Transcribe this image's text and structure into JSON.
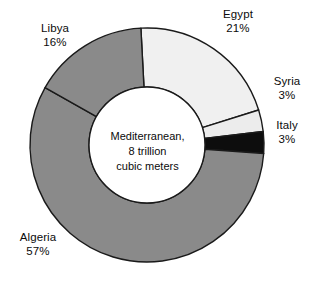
{
  "chart_data": {
    "type": "pie",
    "variant": "donut",
    "title": "",
    "subtitle": "",
    "xlabel": "",
    "ylabel": "",
    "legend_position": "none",
    "grid": false,
    "center_label": {
      "line1": "Mediterranean,",
      "line2": "8 trillion",
      "line3": "cubic meters"
    },
    "total_label": "8 trillion cubic meters",
    "unit": "trillion cubic meters",
    "categories": [
      "Egypt",
      "Syria",
      "Italy",
      "Algeria",
      "Libya"
    ],
    "values": [
      21,
      3,
      3,
      57,
      16
    ],
    "value_suffix": "%",
    "slices": [
      {
        "name": "Egypt",
        "value": 21,
        "label": "Egypt",
        "percent": "21%",
        "color": "#f0f0f0",
        "stroke": "#1a1a1a"
      },
      {
        "name": "Syria",
        "value": 3,
        "label": "Syria",
        "percent": "3%",
        "color": "#ececec",
        "stroke": "#1a1a1a"
      },
      {
        "name": "Italy",
        "value": 3,
        "label": "Italy",
        "percent": "3%",
        "color": "#0d0d0d",
        "stroke": "#1a1a1a"
      },
      {
        "name": "Algeria",
        "value": 57,
        "label": "Algeria",
        "percent": "57%",
        "color": "#8a8a8a",
        "stroke": "#1a1a1a"
      },
      {
        "name": "Libya",
        "value": 16,
        "label": "Libya",
        "percent": "16%",
        "color": "#8a8a8a",
        "stroke": "#1a1a1a"
      }
    ],
    "hole_color": "#ffffff",
    "start_angle_deg": -3,
    "direction": "clockwise",
    "geometry": {
      "cx": 147,
      "cy": 145,
      "outer_r": 117,
      "inner_r": 58
    }
  }
}
